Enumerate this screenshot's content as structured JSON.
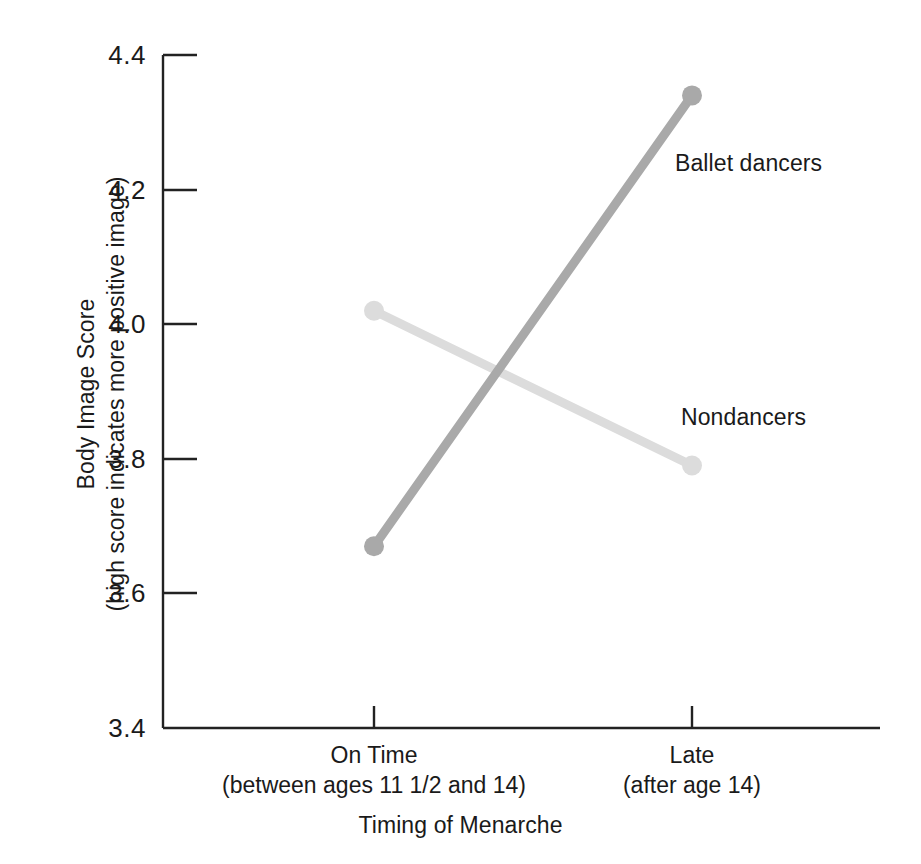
{
  "chart_data": {
    "type": "line",
    "title": "",
    "xlabel": "Timing of Menarche",
    "ylabel_line1": "Body Image Score",
    "ylabel_line2": "(high score indicates more positive image)",
    "categories": [
      "On Time",
      "Late"
    ],
    "category_sublabels": [
      "(between ages 11 1/2 and 14)",
      "(after age 14)"
    ],
    "ylim": [
      3.4,
      4.4
    ],
    "ytick_labels": [
      "4.4",
      "4.2",
      "4.0",
      "3.8",
      "3.6",
      "3.4"
    ],
    "ytick_values": [
      4.4,
      4.2,
      4.0,
      3.8,
      3.6,
      3.4
    ],
    "grid": false,
    "legend": "inline-annotations",
    "series": [
      {
        "name": "Ballet dancers",
        "values": [
          3.67,
          4.34
        ],
        "color": "#a9a9a9",
        "label_x": 675,
        "label_y": 150
      },
      {
        "name": "Nondancers",
        "values": [
          4.02,
          3.79
        ],
        "color": "#dcdcdc",
        "label_x": 681,
        "label_y": 404
      }
    ]
  },
  "axes": {
    "line_color": "#222222",
    "tick_color": "#222222"
  }
}
